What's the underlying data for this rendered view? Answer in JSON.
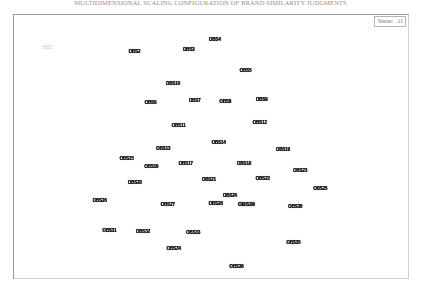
{
  "title": "MULTIDIMENSIONAL SCALING CONFIGURATION OF BRAND SIMILARITY JUDGMENTS",
  "stress": {
    "label": "Stress:",
    "value": ".11"
  },
  "chart_data": {
    "type": "scatter",
    "title": "MULTIDIMENSIONAL SCALING CONFIGURATION OF BRAND SIMILARITY JUDGMENTS",
    "xlabel": "",
    "ylabel": "",
    "xlim": [
      0,
      100
    ],
    "ylim": [
      0,
      100
    ],
    "grid": false,
    "legend": "none",
    "annotations": [
      "Stress: .11"
    ],
    "points": [
      {
        "label": "OBS1",
        "x": 6.2,
        "y": 9.8,
        "size": "faint"
      },
      {
        "label": "OBS2",
        "x": 29.5,
        "y": 11.2,
        "size": "small"
      },
      {
        "label": "OBS3",
        "x": 44.0,
        "y": 10.6,
        "size": "small"
      },
      {
        "label": "OBS4",
        "x": 51.0,
        "y": 6.5,
        "size": "small"
      },
      {
        "label": "OBS5",
        "x": 59.2,
        "y": 18.9,
        "size": "small"
      },
      {
        "label": "OBS6",
        "x": 33.8,
        "y": 31.8,
        "size": "small"
      },
      {
        "label": "OBS7",
        "x": 45.6,
        "y": 31.0,
        "size": "small"
      },
      {
        "label": "OBS8",
        "x": 53.8,
        "y": 31.4,
        "size": "small"
      },
      {
        "label": "OBS9",
        "x": 63.5,
        "y": 30.6,
        "size": "small"
      },
      {
        "label": "OBS10",
        "x": 39.8,
        "y": 24.4,
        "size": "small"
      },
      {
        "label": "OBS11",
        "x": 41.3,
        "y": 41.2,
        "size": "small"
      },
      {
        "label": "OBS12",
        "x": 63.0,
        "y": 40.2,
        "size": "small"
      },
      {
        "label": "OBS13",
        "x": 37.2,
        "y": 50.5,
        "size": "small"
      },
      {
        "label": "OBS14",
        "x": 52.0,
        "y": 48.2,
        "size": "small"
      },
      {
        "label": "OBS15",
        "x": 27.4,
        "y": 54.6,
        "size": "small"
      },
      {
        "label": "OBS16",
        "x": 34.0,
        "y": 57.8,
        "size": "small"
      },
      {
        "label": "OBS17",
        "x": 43.2,
        "y": 56.8,
        "size": "small"
      },
      {
        "label": "OBS18",
        "x": 58.8,
        "y": 56.5,
        "size": "small"
      },
      {
        "label": "OBS19",
        "x": 69.2,
        "y": 51.0,
        "size": "small"
      },
      {
        "label": "OBS20",
        "x": 29.6,
        "y": 64.3,
        "size": "small"
      },
      {
        "label": "OBS21",
        "x": 49.4,
        "y": 63.2,
        "size": "small"
      },
      {
        "label": "OBS22",
        "x": 63.8,
        "y": 62.8,
        "size": "small"
      },
      {
        "label": "OBS23",
        "x": 73.8,
        "y": 59.4,
        "size": "small"
      },
      {
        "label": "OBS24",
        "x": 55.0,
        "y": 69.7,
        "size": "small"
      },
      {
        "label": "OBS25",
        "x": 79.2,
        "y": 66.8,
        "size": "small"
      },
      {
        "label": "OBS26",
        "x": 20.2,
        "y": 71.8,
        "size": "small"
      },
      {
        "label": "OBS27",
        "x": 38.4,
        "y": 73.4,
        "size": "small"
      },
      {
        "label": "OBS28",
        "x": 51.2,
        "y": 73.0,
        "size": "small"
      },
      {
        "label": "OBS29",
        "x": 59.4,
        "y": 73.4,
        "size": "big"
      },
      {
        "label": "OBS30",
        "x": 72.5,
        "y": 74.2,
        "size": "small"
      },
      {
        "label": "OBS31",
        "x": 22.8,
        "y": 83.6,
        "size": "small"
      },
      {
        "label": "OBS32",
        "x": 31.8,
        "y": 84.0,
        "size": "small"
      },
      {
        "label": "OBS33",
        "x": 45.2,
        "y": 84.4,
        "size": "small"
      },
      {
        "label": "OBS34",
        "x": 40.0,
        "y": 91.0,
        "size": "small"
      },
      {
        "label": "OBS35",
        "x": 72.0,
        "y": 88.6,
        "size": "small"
      },
      {
        "label": "OBS36",
        "x": 56.8,
        "y": 98.2,
        "size": "small"
      }
    ]
  }
}
